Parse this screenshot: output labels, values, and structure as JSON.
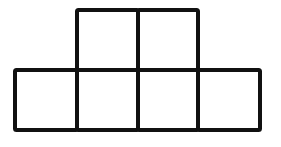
{
  "diagram": {
    "stroke_color": "#111111",
    "background": "#ffffff",
    "top_row": {
      "count": 2,
      "cells": [
        {
          "x": 77,
          "y": 10,
          "w": 61,
          "h": 60
        },
        {
          "x": 138,
          "y": 10,
          "w": 60,
          "h": 60
        }
      ]
    },
    "bottom_row": {
      "count": 4,
      "cells": [
        {
          "x": 15,
          "y": 70,
          "w": 62,
          "h": 60
        },
        {
          "x": 77,
          "y": 70,
          "w": 61,
          "h": 60
        },
        {
          "x": 138,
          "y": 70,
          "w": 60,
          "h": 60
        },
        {
          "x": 198,
          "y": 70,
          "w": 62,
          "h": 60
        }
      ]
    }
  }
}
